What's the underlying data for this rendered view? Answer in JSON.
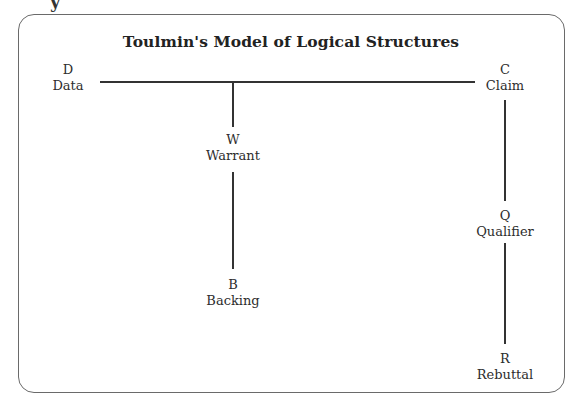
{
  "page": {
    "clipped_header_fragment": "y"
  },
  "diagram": {
    "title": "Toulmin's Model of Logical Structures",
    "nodes": {
      "data": {
        "letter": "D",
        "label": "Data"
      },
      "claim": {
        "letter": "C",
        "label": "Claim"
      },
      "warrant": {
        "letter": "W",
        "label": "Warrant"
      },
      "backing": {
        "letter": "B",
        "label": "Backing"
      },
      "qualifier": {
        "letter": "Q",
        "label": "Qualifier"
      },
      "rebuttal": {
        "letter": "R",
        "label": "Rebuttal"
      }
    },
    "edges": [
      {
        "from": "data",
        "to": "claim"
      },
      {
        "from": "data-claim-line",
        "to": "warrant"
      },
      {
        "from": "warrant",
        "to": "backing"
      },
      {
        "from": "claim",
        "to": "qualifier"
      },
      {
        "from": "qualifier",
        "to": "rebuttal"
      }
    ],
    "colors": {
      "line": "#333333",
      "frame": "#6a6a6a",
      "text": "#2d2d2d"
    }
  }
}
